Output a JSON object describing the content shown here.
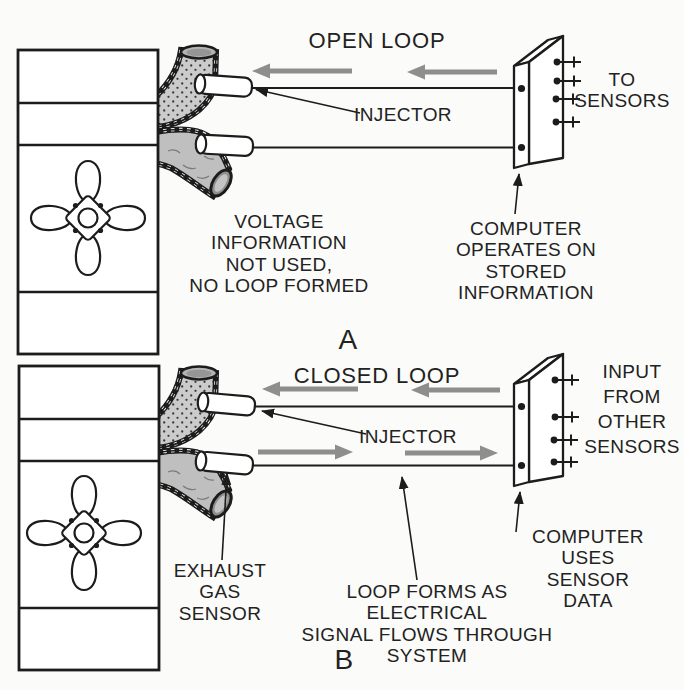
{
  "figure": {
    "colors": {
      "ink": "#1c1c1c",
      "arrow_gray": "#8e8e8e",
      "manifold_light_gray": "#cbcbcb",
      "manifold_gray": "#bfbfbf",
      "background": "#fbfbf9"
    }
  },
  "diagram_a": {
    "title": "OPEN LOOP",
    "section_label": "A",
    "injector_label": "INJECTOR",
    "to_sensors_label": "TO\nSENSORS",
    "voltage_note": "VOLTAGE\nINFORMATION\nNOT USED,\nNO LOOP FORMED",
    "computer_note": "COMPUTER OPERATES ON\nSTORED INFORMATION"
  },
  "diagram_b": {
    "title": "CLOSED LOOP",
    "section_label": "B",
    "injector_label": "INJECTOR",
    "input_note": "INPUT\nFROM\nOTHER\nSENSORS",
    "computer_note": "COMPUTER USES\nSENSOR DATA",
    "exhaust_sensor_label": "EXHAUST\nGAS\nSENSOR",
    "loop_note": "LOOP FORMS AS ELECTRICAL\nSIGNAL FLOWS THROUGH\nSYSTEM"
  }
}
